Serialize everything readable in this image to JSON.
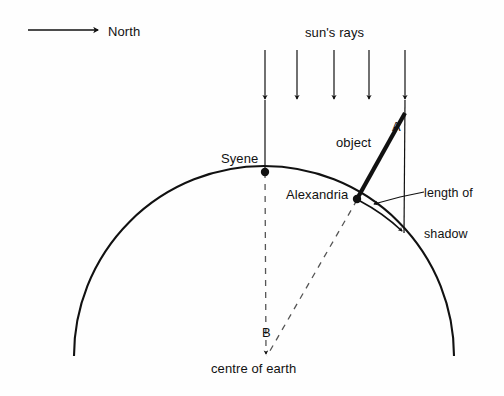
{
  "figure": {
    "background_color": "#fefefe",
    "stroke_color": "#111111",
    "width": 504,
    "height": 396
  },
  "labels": {
    "north": "North",
    "suns_rays": "sun's rays",
    "syene": "Syene",
    "object": "object",
    "angle_a": "A",
    "alexandria": "Alexandria",
    "length_of_shadow_line1": "length of",
    "length_of_shadow_line2": "shadow",
    "angle_b": "B",
    "centre_of_earth": "centre of earth"
  },
  "geometry": {
    "earth_arc": {
      "center_x": 264,
      "center_y": 356,
      "radius": 190,
      "left_end": {
        "x": 74,
        "y": 356
      },
      "right_end": {
        "x": 454,
        "y": 356
      },
      "apex": {
        "x": 264,
        "y": 166
      }
    },
    "syene_point": {
      "x": 265,
      "y": 172
    },
    "alexandria_point": {
      "x": 357,
      "y": 199
    },
    "object_top": {
      "x": 405,
      "y": 113
    },
    "shadow_end": {
      "x": 404,
      "y": 233
    },
    "north_arrow": {
      "x1": 28,
      "y1": 30,
      "x2": 100,
      "y2": 30
    },
    "sun_rays_x": [
      265,
      297,
      334,
      369,
      405
    ],
    "sun_rays_y_start": 50,
    "sun_rays_y_tip": 105,
    "dashed_syene_radius": {
      "x1": 265,
      "y1": 172,
      "x2": 266,
      "y2": 358
    },
    "dashed_alexandria_radius": {
      "x1": 357,
      "y1": 199,
      "x2": 266,
      "y2": 358
    },
    "shadow_leader": {
      "x1": 422,
      "y1": 192,
      "x2": 372,
      "y2": 205
    }
  }
}
